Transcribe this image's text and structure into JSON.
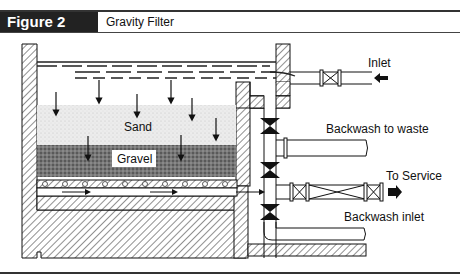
{
  "header": {
    "figure_label": "Figure 2",
    "title": "Gravity Filter"
  },
  "diagram": {
    "labels": {
      "sand": "Sand",
      "gravel": "Gravel",
      "inlet": "Inlet",
      "backwash_to_waste": "Backwash to waste",
      "to_service": "To Service",
      "backwash_inlet": "Backwash inlet"
    },
    "colors": {
      "header_bg": "#222222",
      "line": "#111111",
      "sand": "#e6e6e6",
      "gravel": "#6e6e6e"
    }
  }
}
